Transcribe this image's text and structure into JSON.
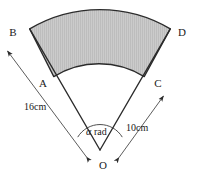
{
  "figure": {
    "canvas": {
      "width": 198,
      "height": 173,
      "background": "#ffffff"
    },
    "shading": {
      "fill_color": "#c9c9c9",
      "hatch_color": "#b4b4b4",
      "stroke_color": "#2b2b2b",
      "description": "shaded annular sector ABDC"
    },
    "labels": {
      "vertex_b": "B",
      "vertex_d": "D",
      "vertex_a": "A",
      "vertex_c": "C",
      "vertex_o": "O",
      "outer_radius": "16cm",
      "inner_radius": "10cm",
      "angle_symbol": "α",
      "angle_unit": "rad"
    },
    "geometry": {
      "center": {
        "x": 100,
        "y": 150
      },
      "inner_radius_px": 86,
      "outer_radius_px": 138,
      "start_angle_deg": 211,
      "end_angle_deg": 329,
      "angle_arc_radius_px": 26
    },
    "measurements": [
      {
        "name": "outer-radius",
        "value": 16,
        "unit": "cm",
        "label": "16cm",
        "from": "O",
        "to": "B"
      },
      {
        "name": "inner-radius",
        "value": 10,
        "unit": "cm",
        "label": "10cm",
        "from": "O",
        "to": "C"
      },
      {
        "name": "central-angle",
        "value": "α",
        "unit": "rad",
        "label": "α rad",
        "at": "O"
      }
    ]
  }
}
